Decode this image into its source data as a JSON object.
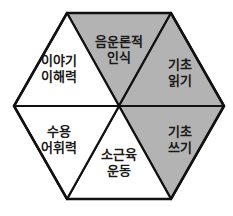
{
  "diagram": {
    "type": "hexagon-segments",
    "colors": {
      "shaded": "#b3b3b3",
      "unshaded": "#ffffff",
      "stroke": "#111111"
    },
    "segments": [
      {
        "id": "top",
        "line1": "음운론적",
        "line2": "인식",
        "shaded": true
      },
      {
        "id": "upper-right",
        "line1": "기초",
        "line2": "읽기",
        "shaded": true
      },
      {
        "id": "lower-right",
        "line1": "기초",
        "line2": "쓰기",
        "shaded": true
      },
      {
        "id": "bottom",
        "line1": "소근육",
        "line2": "운동",
        "shaded": false
      },
      {
        "id": "lower-left",
        "line1": "수용",
        "line2": "어휘력",
        "shaded": false
      },
      {
        "id": "upper-left",
        "line1": "이야기",
        "line2": "이해력",
        "shaded": false
      }
    ]
  }
}
